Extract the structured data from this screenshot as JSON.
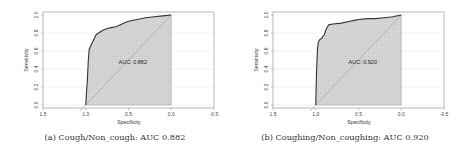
{
  "chart_data": [
    {
      "type": "line",
      "subtype": "roc",
      "title": "",
      "caption": "(a) Cough/Non_cough: AUC 0.882",
      "xlabel": "Specificity",
      "ylabel": "Sensitivity",
      "xlim": [
        1.5,
        -0.5
      ],
      "ylim": [
        0.0,
        1.0
      ],
      "xticks": [
        "1.5",
        "1.0",
        "0.5",
        "0.0",
        "-0.5"
      ],
      "yticks": [
        "0.0",
        "0.2",
        "0.4",
        "0.6",
        "0.8",
        "1.0"
      ],
      "annotation": "AUC: 0.882",
      "auc": 0.882,
      "series": [
        {
          "name": "ROC",
          "specificity": [
            1.0,
            0.98,
            0.97,
            0.96,
            0.94,
            0.92,
            0.9,
            0.88,
            0.85,
            0.8,
            0.75,
            0.7,
            0.65,
            0.6,
            0.55,
            0.5,
            0.4,
            0.3,
            0.2,
            0.1,
            0.0
          ],
          "sensitivity": [
            0.0,
            0.3,
            0.5,
            0.62,
            0.66,
            0.7,
            0.74,
            0.78,
            0.8,
            0.83,
            0.85,
            0.86,
            0.87,
            0.89,
            0.91,
            0.93,
            0.95,
            0.97,
            0.98,
            0.99,
            1.0
          ]
        },
        {
          "name": "chance",
          "specificity": [
            1.0,
            0.0
          ],
          "sensitivity": [
            0.0,
            1.0
          ]
        }
      ],
      "grid": true
    },
    {
      "type": "line",
      "subtype": "roc",
      "title": "",
      "caption": "(b) Coughing/Non_coughing: AUC 0.920",
      "xlabel": "Specificity",
      "ylabel": "Sensitivity",
      "xlim": [
        1.5,
        -0.5
      ],
      "ylim": [
        0.0,
        1.0
      ],
      "xticks": [
        "1.5",
        "1.0",
        "0.5",
        "0.0",
        "-0.5"
      ],
      "yticks": [
        "0.0",
        "0.2",
        "0.4",
        "0.6",
        "0.8",
        "1.0"
      ],
      "annotation": "AUC: 0.920",
      "auc": 0.92,
      "series": [
        {
          "name": "ROC",
          "specificity": [
            1.0,
            0.99,
            0.98,
            0.97,
            0.95,
            0.93,
            0.92,
            0.9,
            0.88,
            0.85,
            0.8,
            0.7,
            0.6,
            0.55,
            0.5,
            0.4,
            0.3,
            0.2,
            0.1,
            0.0
          ],
          "sensitivity": [
            0.0,
            0.4,
            0.62,
            0.7,
            0.73,
            0.74,
            0.76,
            0.78,
            0.84,
            0.89,
            0.9,
            0.91,
            0.93,
            0.94,
            0.95,
            0.96,
            0.96,
            0.97,
            0.98,
            1.0
          ]
        },
        {
          "name": "chance",
          "specificity": [
            1.0,
            0.0
          ],
          "sensitivity": [
            0.0,
            1.0
          ]
        }
      ],
      "grid": true
    }
  ],
  "figure": {
    "captions": [
      "(a) Cough/Non_cough: AUC 0.882",
      "(b) Coughing/Non_coughing: AUC 0.920"
    ]
  },
  "colors": {
    "curve": "#333333",
    "fill": "#d6d6d6",
    "diagonal": "#9a9a9a",
    "axis": "#888888",
    "grid": "#efefef"
  }
}
